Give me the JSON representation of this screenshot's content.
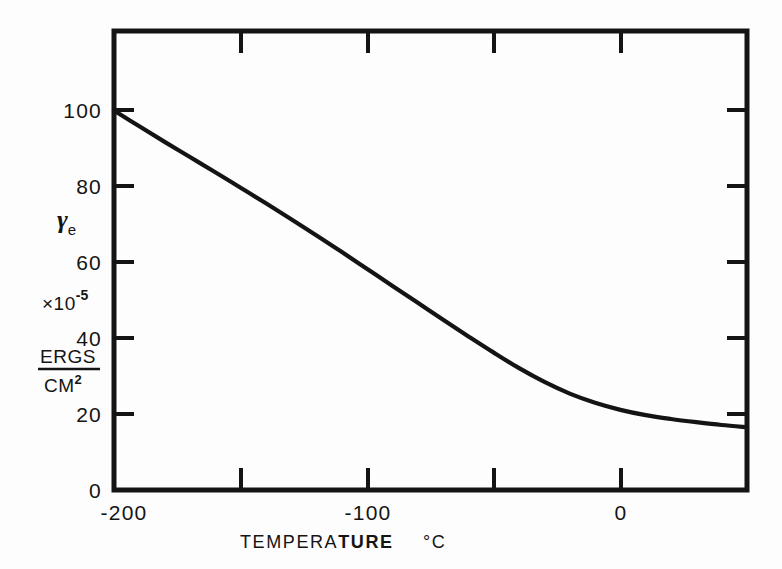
{
  "figure": {
    "background_color": "#fdfdfd",
    "ink_color": "#141414"
  },
  "chart_data": {
    "type": "line",
    "title": "",
    "subtitle": "",
    "xlabel": "TEMPERATURE",
    "xlabel_bold_part": "TURE",
    "xlabel_lead_part": "TEMPERA",
    "x_unit": "°C",
    "ylabel_symbol": "γ",
    "ylabel_subscript": "e",
    "ylabel_scale_base": "×10",
    "ylabel_scale_exponent": "-5",
    "ylabel_unit_numerator": "ERGS",
    "ylabel_unit_denominator": "CM",
    "ylabel_unit_denominator_sup": "2",
    "xlim": [
      -200,
      50
    ],
    "ylim": [
      0,
      130
    ],
    "x_major_ticks": [
      -200,
      -100,
      0
    ],
    "x_major_tick_labels": [
      "-200",
      "-100",
      "0"
    ],
    "x_minor_ticks": [
      -150,
      -50
    ],
    "x_top_ticks": [
      -150,
      -100,
      -50,
      0
    ],
    "y_major_ticks": [
      0,
      20,
      40,
      60,
      80,
      100
    ],
    "y_major_tick_labels": [
      "0",
      "20",
      "40",
      "60",
      "80",
      "100"
    ],
    "y_right_ticks": [
      20,
      40,
      60,
      80,
      100
    ],
    "grid": false,
    "legend": null,
    "series": [
      {
        "name": "surface energy",
        "color": "#141414",
        "line_width": 4.2,
        "x": [
          -200,
          -190,
          -180,
          -170,
          -160,
          -150,
          -140,
          -130,
          -120,
          -110,
          -100,
          -90,
          -80,
          -70,
          -60,
          -50,
          -40,
          -30,
          -20,
          -10,
          0,
          10,
          20,
          30,
          40,
          50
        ],
        "y": [
          107.5,
          103.0,
          98.6,
          94.3,
          90.0,
          85.6,
          81.2,
          76.7,
          72.1,
          67.4,
          62.6,
          57.8,
          53.0,
          48.2,
          43.5,
          38.9,
          34.5,
          30.6,
          27.3,
          24.7,
          22.7,
          21.2,
          20.1,
          19.2,
          18.4,
          17.8
        ]
      }
    ]
  },
  "annotations": {
    "x_axis_caption_spacing": "   "
  }
}
